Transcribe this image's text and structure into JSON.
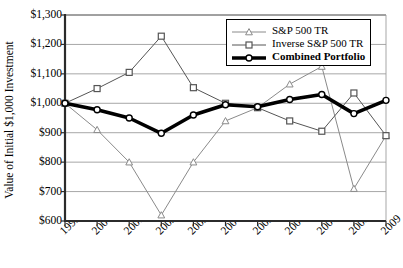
{
  "chart_data": {
    "type": "line",
    "title": "",
    "xlabel": "",
    "ylabel": "Value of Initial $1,000 Investment",
    "categories": [
      "1999",
      "2000",
      "2001",
      "2002",
      "2003",
      "2004",
      "2005",
      "2006",
      "2007",
      "2008",
      "2009"
    ],
    "x": [
      1999,
      2000,
      2001,
      2002,
      2003,
      2004,
      2005,
      2006,
      2007,
      2008,
      2009
    ],
    "ylim": [
      600,
      1300
    ],
    "yticks": [
      600,
      700,
      800,
      900,
      1000,
      1100,
      1200,
      1300
    ],
    "ytick_labels": [
      "$600",
      "$700",
      "$800",
      "$900",
      "$1,000",
      "$1,100",
      "$1,200",
      "$1,300"
    ],
    "grid": true,
    "legend_position": "top-right",
    "series": [
      {
        "name": "S&P 500 TR",
        "marker": "triangle",
        "color": "#8a8a8a",
        "line_width": 1,
        "values": [
          1000,
          910,
          800,
          620,
          800,
          940,
          985,
          1065,
          1125,
          710,
          890
        ]
      },
      {
        "name": "Inverse S&P 500 TR",
        "marker": "square",
        "color": "#555555",
        "line_width": 1,
        "values": [
          1000,
          1050,
          1105,
          1228,
          1053,
          1000,
          985,
          940,
          905,
          1035,
          890
        ]
      },
      {
        "name": "Combined Portfolio",
        "marker": "circle",
        "color": "#000000",
        "line_width": 3.6,
        "values": [
          1000,
          978,
          950,
          898,
          960,
          995,
          988,
          1013,
          1030,
          965,
          1010
        ]
      }
    ]
  },
  "legend": {
    "items": [
      {
        "label": "S&P 500 TR",
        "bold": false
      },
      {
        "label": "Inverse S&P 500 TR",
        "bold": false
      },
      {
        "label": "Combined Portfolio",
        "bold": true
      }
    ]
  },
  "axes": {
    "y_title": "Value of Initial $1,000 Investment"
  }
}
